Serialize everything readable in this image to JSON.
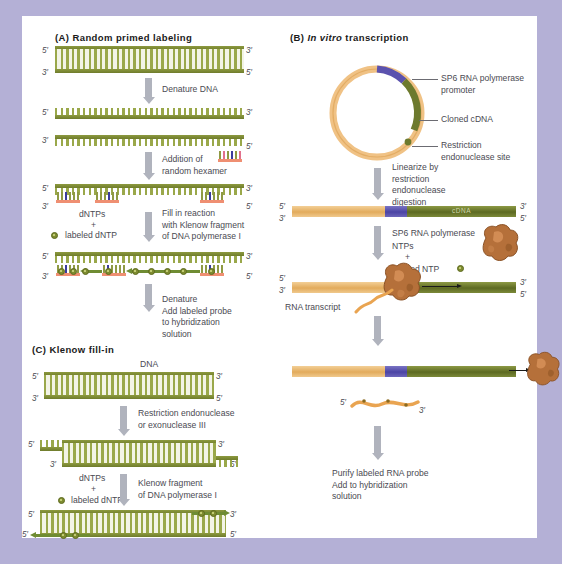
{
  "figure": {
    "background_color": "#b4b0d6",
    "card_color": "#ffffff"
  },
  "panels": [
    {
      "id": "A",
      "title_prefix": "(A)",
      "title": "Random primed labeling",
      "steps": [
        "Denature DNA",
        "Addition of\nrandom hexamer",
        "Fill in reaction\nwith Klenow fragment\nof DNA polymerase I",
        "Denature\nAdd labeled probe\nto hybridization\nsolution"
      ],
      "reagents": {
        "dntps": "dNTPs",
        "plus": "+",
        "labeled": "labeled dNTP"
      },
      "end_labels": {
        "five": "5′",
        "three": "3′"
      }
    },
    {
      "id": "B",
      "title_prefix": "(B)",
      "title_italic": "In vitro",
      "title": "transcription",
      "plasmid_callouts": [
        "SP6 RNA polymerase\npromoter",
        "Cloned cDNA",
        "Restriction\nendonuclease site"
      ],
      "steps": [
        "Linearize by\nrestriction\nendonuclease\ndigestion",
        "Purify labeled RNA probe\nAdd to hybridization\nsolution"
      ],
      "reagents": {
        "enzyme": "SP6 RNA polymerase",
        "ntps": "NTPs",
        "plus": "+",
        "labeled": "labeled NTP"
      },
      "construct_label": "cDNA",
      "transcript_label": "RNA transcript",
      "end_labels": {
        "five": "5′",
        "three": "3′"
      }
    },
    {
      "id": "C",
      "title_prefix": "(C)",
      "title": "Klenow fill-in",
      "dna_label": "DNA",
      "steps": [
        "Restriction endonuclease\nor exonuclease III",
        "Klenow fragment\nof DNA polymerase I"
      ],
      "reagents": {
        "dntps": "dNTPs",
        "plus": "+",
        "labeled": "labeled dNTP"
      },
      "end_labels": {
        "five": "5′",
        "three": "3′"
      }
    }
  ],
  "colors": {
    "dna_backbone": "#6f7c2c",
    "dna_rung": "#9aa84a",
    "primer": "#ef8f72",
    "promoter": "#4b44a4",
    "vector": "#e2ab5c",
    "cdna": "#5d6a22",
    "polymerase": "#b5703a",
    "arrow_gray": "#b0b3bd",
    "label_dot": "#7e8c30",
    "text": "#4a4a52"
  }
}
